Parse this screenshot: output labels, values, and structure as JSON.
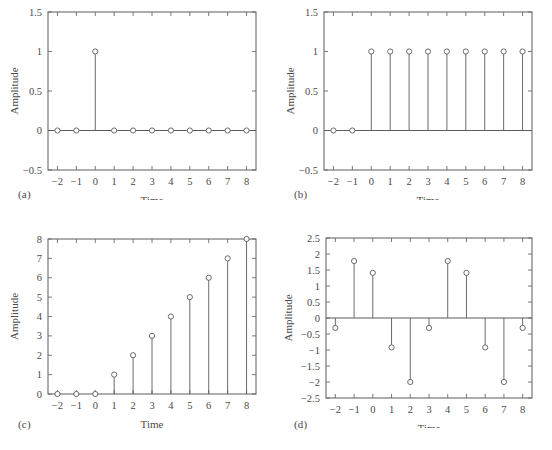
{
  "figure": {
    "background_color": "#ffffff",
    "line_color": "#5a5a5a",
    "text_color": "#4a4a4a",
    "panel_letters": [
      "(a)",
      "(b)",
      "(c)",
      "(d)"
    ]
  },
  "chart_data": [
    {
      "type": "scatter",
      "plot_style": "stem",
      "panel": "(a)",
      "title": "",
      "xlabel": "Time",
      "ylabel": "Amplitude",
      "x": [
        -2,
        -1,
        0,
        1,
        2,
        3,
        4,
        5,
        6,
        7,
        8
      ],
      "values": [
        0,
        0,
        1,
        0,
        0,
        0,
        0,
        0,
        0,
        0,
        0
      ],
      "xlim": [
        -2.5,
        8.5
      ],
      "ylim": [
        -0.5,
        1.5
      ],
      "xticks": [
        -2,
        -1,
        0,
        1,
        2,
        3,
        4,
        5,
        6,
        7,
        8
      ],
      "xtick_labels": [
        "−2",
        "−1",
        "0",
        "1",
        "2",
        "3",
        "4",
        "5",
        "6",
        "7",
        "8"
      ],
      "yticks": [
        -0.5,
        0,
        0.5,
        1,
        1.5
      ],
      "ytick_labels": [
        "−0.5",
        "0",
        "0.5",
        "1",
        "1.5"
      ],
      "grid": false,
      "legend": "none",
      "marker": "open-circle"
    },
    {
      "type": "scatter",
      "plot_style": "stem",
      "panel": "(b)",
      "title": "",
      "xlabel": "Time",
      "ylabel": "Amplitude",
      "x": [
        -2,
        -1,
        0,
        1,
        2,
        3,
        4,
        5,
        6,
        7,
        8
      ],
      "values": [
        0,
        0,
        1,
        1,
        1,
        1,
        1,
        1,
        1,
        1,
        1
      ],
      "xlim": [
        -2.5,
        8.5
      ],
      "ylim": [
        -0.5,
        1.5
      ],
      "xticks": [
        -2,
        -1,
        0,
        1,
        2,
        3,
        4,
        5,
        6,
        7,
        8
      ],
      "xtick_labels": [
        "−2",
        "−1",
        "0",
        "1",
        "2",
        "3",
        "4",
        "5",
        "6",
        "7",
        "8"
      ],
      "yticks": [
        -0.5,
        0,
        0.5,
        1,
        1.5
      ],
      "ytick_labels": [
        "−0.5",
        "0",
        "0.5",
        "1",
        "1.5"
      ],
      "grid": false,
      "legend": "none",
      "marker": "open-circle"
    },
    {
      "type": "scatter",
      "plot_style": "stem",
      "panel": "(c)",
      "title": "",
      "xlabel": "Time",
      "ylabel": "Amplitude",
      "x": [
        -2,
        -1,
        0,
        1,
        2,
        3,
        4,
        5,
        6,
        7,
        8
      ],
      "values": [
        0,
        0,
        0,
        1,
        2,
        3,
        4,
        5,
        6,
        7,
        8
      ],
      "xlim": [
        -2.5,
        8.5
      ],
      "ylim": [
        0,
        8
      ],
      "xticks": [
        -2,
        -1,
        0,
        1,
        2,
        3,
        4,
        5,
        6,
        7,
        8
      ],
      "xtick_labels": [
        "−2",
        "−1",
        "0",
        "1",
        "2",
        "3",
        "4",
        "5",
        "6",
        "7",
        "8"
      ],
      "yticks": [
        0,
        1,
        2,
        3,
        4,
        5,
        6,
        7,
        8
      ],
      "ytick_labels": [
        "0",
        "1",
        "2",
        "3",
        "4",
        "5",
        "6",
        "7",
        "8"
      ],
      "grid": false,
      "legend": "none",
      "marker": "open-circle"
    },
    {
      "type": "scatter",
      "plot_style": "stem",
      "panel": "(d)",
      "title": "",
      "xlabel": "Time",
      "ylabel": "Amplitude",
      "x": [
        -2,
        -1,
        0,
        1,
        2,
        3,
        4,
        5,
        6,
        7,
        8
      ],
      "values": [
        -0.31,
        1.78,
        1.41,
        -0.92,
        -2.0,
        -0.31,
        1.78,
        1.41,
        -0.92,
        -2.0,
        -0.31
      ],
      "xlim": [
        -2.5,
        8.5
      ],
      "ylim": [
        -2.5,
        2.5
      ],
      "xticks": [
        -2,
        -1,
        0,
        1,
        2,
        3,
        4,
        5,
        6,
        7,
        8
      ],
      "xtick_labels": [
        "−2",
        "−1",
        "0",
        "1",
        "2",
        "3",
        "4",
        "5",
        "6",
        "7",
        "8"
      ],
      "yticks": [
        -2.5,
        -2,
        -1.5,
        -1,
        -0.5,
        0,
        0.5,
        1,
        1.5,
        2,
        2.5
      ],
      "ytick_labels": [
        "−2.5",
        "−2",
        "−1.5",
        "−1",
        "−0.5",
        "0",
        "0.5",
        "1",
        "1.5",
        "2",
        "2.5"
      ],
      "grid": false,
      "legend": "none",
      "marker": "open-circle"
    }
  ]
}
